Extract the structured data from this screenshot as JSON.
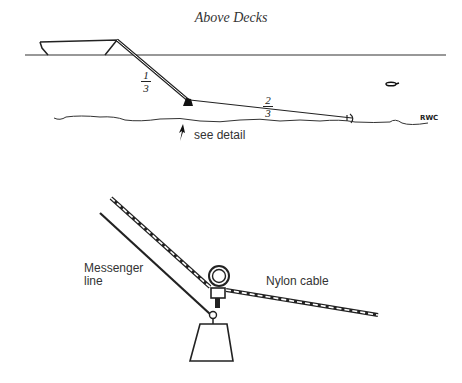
{
  "title": "Above Decks",
  "top_diagram": {
    "fraction_upper": {
      "numerator": "1",
      "denominator": "3"
    },
    "fraction_lower": {
      "numerator": "2",
      "denominator": "3"
    },
    "signature": "RWC",
    "callout": "see detail"
  },
  "detail_diagram": {
    "label_left_line1": "Messenger",
    "label_left_line2": "line",
    "label_right": "Nylon cable"
  }
}
